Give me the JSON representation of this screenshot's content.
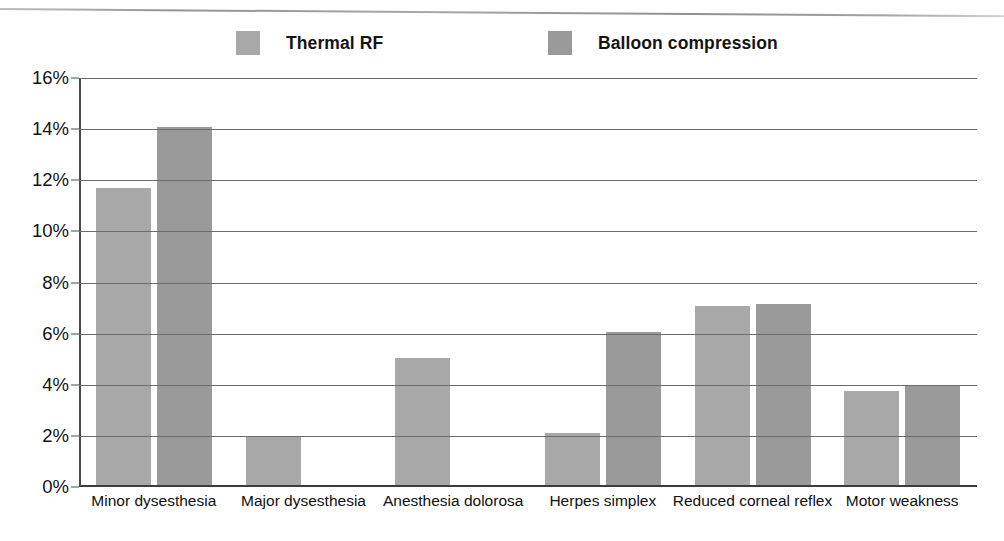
{
  "figure": {
    "background_color": "#ffffff",
    "has_top_rule": true
  },
  "legend": {
    "position": "top",
    "entries": [
      {
        "label": "Thermal RF",
        "color": "#a8a8a8"
      },
      {
        "label": "Balloon compression",
        "color": "#9a9a9a"
      }
    ]
  },
  "chart_data": {
    "type": "bar",
    "title": "",
    "subtitle": "",
    "xlabel": "",
    "ylabel": "",
    "ylim": [
      0,
      16
    ],
    "ytick_values": [
      0,
      2,
      4,
      6,
      8,
      10,
      12,
      14,
      16
    ],
    "ytick_labels": [
      "0%",
      "2%",
      "4%",
      "6%",
      "8%",
      "10%",
      "12%",
      "14%",
      "16%"
    ],
    "grid": true,
    "grid_axis": "y",
    "legend_position": "top",
    "categories": [
      "Minor dysesthesia",
      "Major dysesthesia",
      "Anesthesia dolorosa",
      "Herpes simplex",
      "Reduced corneal reflex",
      "Motor weakness"
    ],
    "series": [
      {
        "name": "Thermal RF",
        "color": "#a8a8a8",
        "values": [
          11.7,
          2.0,
          5.05,
          2.1,
          7.1,
          3.75
        ]
      },
      {
        "name": "Balloon compression",
        "color": "#9a9a9a",
        "values": [
          14.1,
          null,
          null,
          6.05,
          7.15,
          3.95
        ]
      }
    ]
  }
}
